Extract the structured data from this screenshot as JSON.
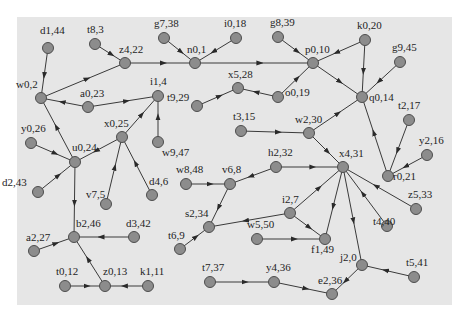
{
  "diagram": {
    "type": "directed-graph",
    "background": "#e6e6e6",
    "node_color": "#8c8c8c",
    "edge_color": "#3a3a3a",
    "nodes": [
      {
        "id": "d1,44",
        "x": 48,
        "y": 48,
        "lx": -8,
        "ly": -14
      },
      {
        "id": "t8,3",
        "x": 95,
        "y": 44,
        "lx": -8,
        "ly": -11
      },
      {
        "id": "z4,22",
        "x": 125,
        "y": 63,
        "lx": -6,
        "ly": -10
      },
      {
        "id": "g7,38",
        "x": 164,
        "y": 38,
        "lx": -10,
        "ly": -11
      },
      {
        "id": "i0,18",
        "x": 236,
        "y": 38,
        "lx": -12,
        "ly": -11
      },
      {
        "id": "n0,1",
        "x": 195,
        "y": 63,
        "lx": -8,
        "ly": -10
      },
      {
        "id": "g8,39",
        "x": 278,
        "y": 37,
        "lx": -8,
        "ly": -11
      },
      {
        "id": "p0,10",
        "x": 313,
        "y": 63,
        "lx": -8,
        "ly": -10
      },
      {
        "id": "k0,20",
        "x": 365,
        "y": 40,
        "lx": -8,
        "ly": -11
      },
      {
        "id": "g9,45",
        "x": 400,
        "y": 62,
        "lx": -8,
        "ly": -11
      },
      {
        "id": "w0,2",
        "x": 41,
        "y": 98,
        "lx": -25,
        "ly": -10
      },
      {
        "id": "a0,23",
        "x": 88,
        "y": 107,
        "lx": -8,
        "ly": -10
      },
      {
        "id": "i1,4",
        "x": 158,
        "y": 96,
        "lx": -8,
        "ly": -11
      },
      {
        "id": "x5,28",
        "x": 238,
        "y": 88,
        "lx": -10,
        "ly": -10
      },
      {
        "id": "o0,19",
        "x": 278,
        "y": 97,
        "lx": 7,
        "ly": -1
      },
      {
        "id": "t9,29",
        "x": 197,
        "y": 106,
        "lx": -30,
        "ly": -5
      },
      {
        "id": "q0,14",
        "x": 362,
        "y": 97,
        "lx": 7,
        "ly": 4
      },
      {
        "id": "t2,17",
        "x": 409,
        "y": 120,
        "lx": -11,
        "ly": -11
      },
      {
        "id": "y0,26",
        "x": 31,
        "y": 143,
        "lx": -10,
        "ly": -11
      },
      {
        "id": "u0,24",
        "x": 75,
        "y": 162,
        "lx": -3,
        "ly": -11
      },
      {
        "id": "x0,25",
        "x": 122,
        "y": 137,
        "lx": -18,
        "ly": -10
      },
      {
        "id": "w9,47",
        "x": 158,
        "y": 142,
        "lx": 4,
        "ly": 14
      },
      {
        "id": "t3,15",
        "x": 241,
        "y": 131,
        "lx": -8,
        "ly": -11
      },
      {
        "id": "w2,30",
        "x": 309,
        "y": 133,
        "lx": -14,
        "ly": -10
      },
      {
        "id": "x4,31",
        "x": 343,
        "y": 167,
        "lx": -4,
        "ly": -10
      },
      {
        "id": "y2,16",
        "x": 427,
        "y": 155,
        "lx": -8,
        "ly": -11
      },
      {
        "id": "r0,21",
        "x": 388,
        "y": 176,
        "lx": 5,
        "ly": 4
      },
      {
        "id": "d2,43",
        "x": 38,
        "y": 192,
        "lx": -36,
        "ly": -6
      },
      {
        "id": "v7,5",
        "x": 106,
        "y": 204,
        "lx": -20,
        "ly": -6
      },
      {
        "id": "d4,6",
        "x": 152,
        "y": 195,
        "lx": -3,
        "ly": -10
      },
      {
        "id": "w8,48",
        "x": 186,
        "y": 184,
        "lx": -10,
        "ly": -11
      },
      {
        "id": "v6,8",
        "x": 230,
        "y": 184,
        "lx": -8,
        "ly": -11
      },
      {
        "id": "h2,32",
        "x": 276,
        "y": 167,
        "lx": -8,
        "ly": -11
      },
      {
        "id": "i2,7",
        "x": 290,
        "y": 213,
        "lx": -8,
        "ly": -10
      },
      {
        "id": "s2,34",
        "x": 209,
        "y": 227,
        "lx": -24,
        "ly": -10
      },
      {
        "id": "w5,50",
        "x": 257,
        "y": 239,
        "lx": -10,
        "ly": -11
      },
      {
        "id": "f1,49",
        "x": 325,
        "y": 239,
        "lx": -14,
        "ly": 14
      },
      {
        "id": "t4,40",
        "x": 387,
        "y": 226,
        "lx": -14,
        "ly": -1
      },
      {
        "id": "z5,33",
        "x": 416,
        "y": 209,
        "lx": -8,
        "ly": -11
      },
      {
        "id": "b2,46",
        "x": 74,
        "y": 237,
        "lx": 2,
        "ly": -10
      },
      {
        "id": "d3,42",
        "x": 134,
        "y": 237,
        "lx": -8,
        "ly": -10
      },
      {
        "id": "a2,27",
        "x": 34,
        "y": 251,
        "lx": -8,
        "ly": -10
      },
      {
        "id": "t0,12",
        "x": 65,
        "y": 286,
        "lx": -9,
        "ly": -11
      },
      {
        "id": "z0,13",
        "x": 105,
        "y": 286,
        "lx": -2,
        "ly": -11
      },
      {
        "id": "k1,11",
        "x": 148,
        "y": 286,
        "lx": -8,
        "ly": -11
      },
      {
        "id": "t6,9",
        "x": 180,
        "y": 249,
        "lx": -12,
        "ly": -10
      },
      {
        "id": "t7,37",
        "x": 210,
        "y": 282,
        "lx": -8,
        "ly": -11
      },
      {
        "id": "y4,36",
        "x": 274,
        "y": 282,
        "lx": -8,
        "ly": -11
      },
      {
        "id": "e2,36",
        "x": 332,
        "y": 294,
        "lx": -14,
        "ly": -10
      },
      {
        "id": "j2,0",
        "x": 362,
        "y": 265,
        "lx": -22,
        "ly": -4
      },
      {
        "id": "t5,41",
        "x": 414,
        "y": 277,
        "lx": -8,
        "ly": -11
      }
    ],
    "edges": [
      [
        "d1,44",
        "w0,2"
      ],
      [
        "w0,2",
        "z4,22"
      ],
      [
        "t8,3",
        "z4,22"
      ],
      [
        "z4,22",
        "n0,1"
      ],
      [
        "g7,38",
        "n0,1"
      ],
      [
        "i0,18",
        "n0,1"
      ],
      [
        "n0,1",
        "p0,10"
      ],
      [
        "g8,39",
        "p0,10"
      ],
      [
        "k0,20",
        "p0,10"
      ],
      [
        "k0,20",
        "q0,14"
      ],
      [
        "p0,10",
        "q0,14"
      ],
      [
        "g9,45",
        "q0,14"
      ],
      [
        "o0,19",
        "p0,10"
      ],
      [
        "o0,19",
        "x5,28"
      ],
      [
        "t9,29",
        "x5,28"
      ],
      [
        "a0,23",
        "w0,2"
      ],
      [
        "a0,23",
        "i1,4"
      ],
      [
        "u0,24",
        "w0,2"
      ],
      [
        "x0,25",
        "i1,4"
      ],
      [
        "w9,47",
        "i1,4"
      ],
      [
        "x0,25",
        "u0,24"
      ],
      [
        "y0,26",
        "u0,24"
      ],
      [
        "d2,43",
        "u0,24"
      ],
      [
        "v7,5",
        "x0,25"
      ],
      [
        "d4,6",
        "x0,25"
      ],
      [
        "u0,24",
        "b2,46"
      ],
      [
        "d3,42",
        "b2,46"
      ],
      [
        "a2,27",
        "b2,46"
      ],
      [
        "z0,13",
        "b2,46"
      ],
      [
        "t0,12",
        "z0,13"
      ],
      [
        "k1,11",
        "z0,13"
      ],
      [
        "w2,30",
        "q0,14"
      ],
      [
        "t3,15",
        "w2,30"
      ],
      [
        "w2,30",
        "x4,31"
      ],
      [
        "r0,21",
        "q0,14"
      ],
      [
        "t2,17",
        "r0,21"
      ],
      [
        "y2,16",
        "r0,21"
      ],
      [
        "h2,32",
        "x4,31"
      ],
      [
        "h2,32",
        "v6,8"
      ],
      [
        "w8,48",
        "v6,8"
      ],
      [
        "v6,8",
        "s2,34"
      ],
      [
        "i2,7",
        "s2,34"
      ],
      [
        "t6,9",
        "s2,34"
      ],
      [
        "i2,7",
        "x4,31"
      ],
      [
        "i2,7",
        "f1,49"
      ],
      [
        "w5,50",
        "f1,49"
      ],
      [
        "x4,31",
        "f1,49"
      ],
      [
        "x4,31",
        "j2,0"
      ],
      [
        "t4,40",
        "x4,31"
      ],
      [
        "z5,33",
        "x4,31"
      ],
      [
        "t5,41",
        "j2,0"
      ],
      [
        "j2,0",
        "e2,36"
      ],
      [
        "y4,36",
        "e2,36"
      ],
      [
        "t7,37",
        "y4,36"
      ]
    ]
  }
}
